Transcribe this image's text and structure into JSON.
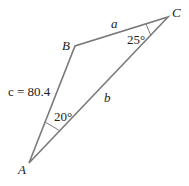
{
  "diagram": {
    "type": "triangle",
    "stroke_color": "#7a7a7a",
    "vertices": {
      "A": {
        "label": "A",
        "x": 29,
        "y": 163
      },
      "B": {
        "label": "B",
        "x": 75,
        "y": 46
      },
      "C": {
        "label": "C",
        "x": 168,
        "y": 17
      }
    },
    "sides": {
      "a": {
        "label": "a"
      },
      "b": {
        "label": "b"
      },
      "c": {
        "label": "c = 80.4",
        "value": "80.4"
      }
    },
    "angles": {
      "A": {
        "label": "20°",
        "value": 20
      },
      "C": {
        "label": "25°",
        "value": 25
      }
    }
  }
}
